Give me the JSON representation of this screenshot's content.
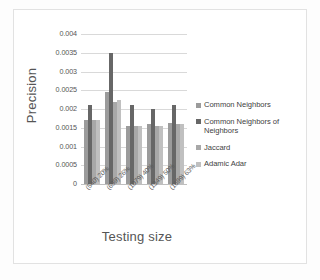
{
  "chart_data": {
    "type": "bar",
    "title": "",
    "xlabel": "Testing size",
    "ylabel": "Precision",
    "categories": [
      "(540) 20%",
      "(699) 26%",
      "(1079) 40%",
      "(1349) 50%",
      "(1699) 63%"
    ],
    "ylim": [
      0,
      0.004
    ],
    "yticks": [
      "0",
      "0.0005",
      "0.001",
      "0.0015",
      "0.002",
      "0.0025",
      "0.003",
      "0.0035",
      "0.004"
    ],
    "ytick_values": [
      0,
      0.0005,
      0.001,
      0.0015,
      0.002,
      0.0025,
      0.003,
      0.0035,
      0.004
    ],
    "grid": true,
    "legend_position": "right",
    "series": [
      {
        "name": "Common Neighbors",
        "color": "#9b9b9b",
        "values": [
          0.00172,
          0.00245,
          0.00155,
          0.0016,
          0.00164
        ]
      },
      {
        "name": "Common Neighbors of Neighbors",
        "color": "#676767",
        "values": [
          0.0021,
          0.0035,
          0.0021,
          0.002,
          0.0021
        ]
      },
      {
        "name": "Jaccard",
        "color": "#a8a8a8",
        "values": [
          0.00172,
          0.0022,
          0.00155,
          0.00155,
          0.0016
        ]
      },
      {
        "name": "Adamic Adar",
        "color": "#c0c0c0",
        "values": [
          0.00172,
          0.00225,
          0.00155,
          0.00155,
          0.0016
        ]
      }
    ]
  },
  "legend": {
    "items": [
      {
        "label": "Common Neighbors"
      },
      {
        "label": "Common Neighbors of Neighbors"
      },
      {
        "label": "Jaccard"
      },
      {
        "label": "Adamic Adar"
      }
    ]
  }
}
